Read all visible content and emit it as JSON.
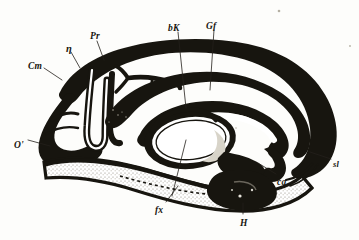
{
  "figure": {
    "kind": "anatomical-engraving",
    "background_color": "#fdfdfb",
    "ink_color": "#17150f",
    "stipple_color": "#8d887c",
    "orientation": "occipital pole at left, frontal pole at right"
  },
  "labels": [
    {
      "id": "Cm",
      "text": "Cm",
      "x": 28,
      "y": 62,
      "size": "md",
      "anchor": "left",
      "region": "upper-left-outer-cortex"
    },
    {
      "id": "eta",
      "text": "η",
      "x": 66,
      "y": 44,
      "size": "lg",
      "anchor": "left",
      "region": "upper-left-sulcus"
    },
    {
      "id": "Pr",
      "text": "Pr",
      "x": 90,
      "y": 32,
      "size": "md",
      "anchor": "left",
      "region": "precuneus"
    },
    {
      "id": "bK",
      "text": "bK",
      "x": 168,
      "y": 24,
      "size": "md",
      "anchor": "left",
      "region": "dorsal-midline-upper"
    },
    {
      "id": "Gf",
      "text": "Gf",
      "x": 206,
      "y": 22,
      "size": "md",
      "anchor": "left",
      "region": "gyrus-fornicatus"
    },
    {
      "id": "O",
      "text": "O'",
      "x": 14,
      "y": 141,
      "size": "md",
      "anchor": "left",
      "region": "occipital-pole"
    },
    {
      "id": "sl",
      "text": "sl",
      "x": 333,
      "y": 160,
      "size": "sm",
      "anchor": "left",
      "region": "frontal-inferior-margin"
    },
    {
      "id": "ca",
      "text": "ca",
      "x": 277,
      "y": 178,
      "size": "md",
      "anchor": "left",
      "region": "anterior-commissure"
    },
    {
      "id": "fx",
      "text": "fx",
      "x": 155,
      "y": 206,
      "size": "md",
      "anchor": "left",
      "region": "fornix"
    },
    {
      "id": "H",
      "text": "H",
      "x": 240,
      "y": 219,
      "size": "md",
      "anchor": "left",
      "region": "hippocampal-formation"
    }
  ],
  "leader_lines": [
    {
      "for": "Cm",
      "x1": 44,
      "y1": 68,
      "x2": 62,
      "y2": 80
    },
    {
      "for": "eta",
      "x1": 71,
      "y1": 52,
      "x2": 80,
      "y2": 68
    },
    {
      "for": "Pr",
      "x1": 97,
      "y1": 41,
      "x2": 104,
      "y2": 60
    },
    {
      "for": "bK",
      "x1": 178,
      "y1": 32,
      "x2": 186,
      "y2": 108
    },
    {
      "for": "Gf",
      "x1": 214,
      "y1": 30,
      "x2": 210,
      "y2": 90
    },
    {
      "for": "O",
      "x1": 28,
      "y1": 140,
      "x2": 50,
      "y2": 146
    },
    {
      "for": "sl",
      "x1": 331,
      "y1": 159,
      "x2": 310,
      "y2": 152
    },
    {
      "for": "ca",
      "x1": 276,
      "y1": 174,
      "x2": 258,
      "y2": 163
    },
    {
      "for": "fx",
      "x1": 166,
      "y1": 202,
      "x2": 178,
      "y2": 186
    },
    {
      "for": "H",
      "x1": 243,
      "y1": 214,
      "x2": 243,
      "y2": 203
    },
    {
      "for": "bK-inner",
      "x1": 186,
      "y1": 140,
      "x2": 172,
      "y2": 196
    }
  ],
  "strokes": {
    "outer_cortex_note": "heavy black band tracing the pial surface over the convexity",
    "callosum_note": "thick arc enclosing the corpus callosum and septum",
    "thalamus_note": "oval body at the centre with open white interior",
    "temporal_note": "stippled temporal lobe with dense black hippocampal mass"
  }
}
